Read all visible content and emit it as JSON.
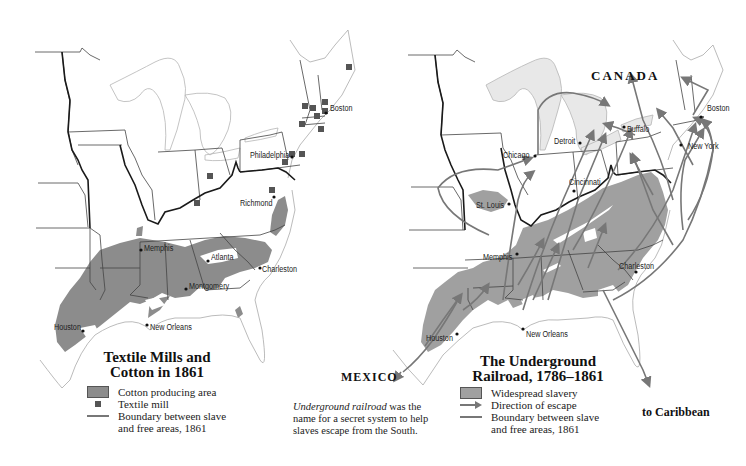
{
  "left_map": {
    "title_line1": "Textile Mills and",
    "title_line2": "Cotton in 1861",
    "cities": {
      "boston": "Boston",
      "philadelphia": "Philadelphia",
      "richmond": "Richmond",
      "memphis": "Memphis",
      "atlanta": "Atlanta",
      "charleston": "Charleston",
      "montgomery": "Montgomery",
      "houston": "Houston",
      "new_orleans": "New Orleans"
    },
    "legend": {
      "cotton_area": "Cotton producing area",
      "textile_mill": "Textile mill",
      "boundary_line1": "Boundary between slave",
      "boundary_line2": "and free areas, 1861"
    },
    "colors": {
      "cotton_area": "#8c8c8c",
      "textile_mill": "#555555",
      "boundary": "#333333"
    }
  },
  "right_map": {
    "title_line1": "The Underground",
    "title_line2": "Railroad, 1786–1861",
    "labels": {
      "canada": "CANADA",
      "mexico": "MEXICO",
      "to_caribbean": "to Caribbean"
    },
    "cities": {
      "boston": "Boston",
      "buffalo": "Buffalo",
      "detroit": "Detroit",
      "chicago": "Chicago",
      "new_york": "New York",
      "cincinnati": "Cincinnati",
      "st_louis": "St. Louis",
      "memphis": "Memphis",
      "charleston": "Charleston",
      "houston": "Houston",
      "new_orleans": "New Orleans"
    },
    "legend": {
      "slavery_area": "Widespread slavery",
      "escape_direction": "Direction of escape",
      "boundary_line1": "Boundary between slave",
      "boundary_line2": "and free areas, 1861"
    },
    "colors": {
      "slavery_area": "#a0a0a0",
      "escape_arrow": "#777777",
      "boundary": "#333333"
    }
  },
  "caption": {
    "italic_term": "Underground railroad",
    "line1_rest": " was the",
    "line2": "name for a secret system to help",
    "line3": "slaves escape from the South."
  }
}
